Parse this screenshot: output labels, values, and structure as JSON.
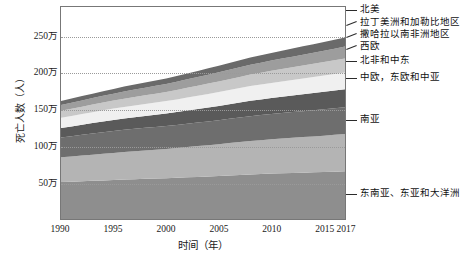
{
  "chart_data": {
    "type": "area",
    "title": "",
    "subtitle": "",
    "xlabel": "时间（年）",
    "ylabel": "死亡人数（人）",
    "xlim": [
      1990,
      2017
    ],
    "ylim": [
      0,
      290
    ],
    "grid": true,
    "legend_position": "right",
    "stacked": true,
    "unit_note": "万人",
    "x": [
      1990,
      1991,
      1992,
      1993,
      1994,
      1995,
      1996,
      1997,
      1998,
      1999,
      2000,
      2001,
      2002,
      2003,
      2004,
      2005,
      2006,
      2007,
      2008,
      2009,
      2010,
      2011,
      2012,
      2013,
      2014,
      2015,
      2016,
      2017
    ],
    "xticks": [
      "1990",
      "1995",
      "2000",
      "2005",
      "2010",
      "2015",
      "2017"
    ],
    "xtick_values": [
      1990,
      1995,
      2000,
      2005,
      2010,
      2015,
      2017
    ],
    "yticks": [
      "50万",
      "100万",
      "150万",
      "200万",
      "250万"
    ],
    "ytick_values": [
      50,
      100,
      150,
      200,
      250
    ],
    "series": [
      {
        "name": "东南亚、东亚和大洋洲",
        "color": "#8e8e8e",
        "values": [
          50.5,
          51.0,
          51.6,
          52.2,
          52.8,
          53.4,
          54.0,
          54.5,
          55.0,
          55.4,
          55.9,
          56.4,
          57.0,
          57.6,
          58.2,
          58.9,
          59.6,
          60.3,
          61.0,
          61.6,
          62.2,
          62.6,
          63.0,
          63.4,
          63.8,
          64.2,
          64.7,
          65.2
        ]
      },
      {
        "name": "南亚",
        "color": "#b4b4b4",
        "values": [
          34.0,
          34.6,
          35.2,
          35.8,
          36.4,
          37.0,
          37.6,
          38.2,
          38.8,
          39.4,
          40.0,
          40.7,
          41.4,
          42.1,
          42.8,
          43.5,
          44.2,
          44.9,
          45.6,
          46.2,
          46.8,
          47.4,
          48.0,
          48.6,
          49.2,
          49.8,
          50.4,
          51.0
        ]
      },
      {
        "name": "中欧，东欧和中亚",
        "color": "#6e6e6e",
        "values": [
          27.0,
          27.6,
          28.3,
          29.0,
          29.6,
          30.1,
          30.5,
          30.8,
          31.0,
          31.2,
          31.4,
          31.6,
          31.9,
          32.2,
          32.5,
          32.8,
          33.2,
          33.6,
          34.0,
          34.3,
          34.6,
          34.9,
          35.2,
          35.5,
          35.8,
          36.1,
          36.4,
          36.7
        ]
      },
      {
        "name": "北非和中东",
        "color": "#5a5a5a",
        "values": [
          13.0,
          13.4,
          13.8,
          14.2,
          14.6,
          15.0,
          15.4,
          15.8,
          16.2,
          16.6,
          17.0,
          17.5,
          18.0,
          18.5,
          19.0,
          19.5,
          20.0,
          20.5,
          21.0,
          21.4,
          21.8,
          22.2,
          22.6,
          23.0,
          23.4,
          23.8,
          24.2,
          24.6
        ]
      },
      {
        "name": "西欧",
        "color": "#f0f0f0",
        "values": [
          14.0,
          14.3,
          14.6,
          14.9,
          15.2,
          15.5,
          15.8,
          16.1,
          16.4,
          16.7,
          17.0,
          17.4,
          17.8,
          18.2,
          18.6,
          19.0,
          19.4,
          19.8,
          20.2,
          20.5,
          20.8,
          21.1,
          21.4,
          21.7,
          22.0,
          22.3,
          22.6,
          22.9
        ]
      },
      {
        "name": "撒哈拉以南非洲地区",
        "color": "#c8c8c8",
        "values": [
          9.5,
          9.8,
          10.1,
          10.4,
          10.7,
          11.0,
          11.3,
          11.6,
          11.9,
          12.2,
          12.5,
          12.9,
          13.3,
          13.7,
          14.1,
          14.5,
          14.9,
          15.3,
          15.7,
          16.1,
          16.5,
          16.9,
          17.3,
          17.7,
          18.1,
          18.5,
          18.9,
          19.3
        ]
      },
      {
        "name": "拉丁美洲和加勒比地区",
        "color": "#9d9d9d",
        "values": [
          8.0,
          8.3,
          8.6,
          8.9,
          9.2,
          9.5,
          9.8,
          10.1,
          10.4,
          10.7,
          11.0,
          11.3,
          11.6,
          11.9,
          12.2,
          12.5,
          12.8,
          13.1,
          13.4,
          13.7,
          14.0,
          14.3,
          14.6,
          14.9,
          15.2,
          15.5,
          15.8,
          16.1
        ]
      },
      {
        "name": "北美",
        "color": "#6a6a6a",
        "values": [
          5.5,
          5.7,
          5.9,
          6.1,
          6.3,
          6.5,
          6.7,
          6.9,
          7.1,
          7.3,
          7.5,
          7.8,
          8.1,
          8.4,
          8.7,
          9.0,
          9.3,
          9.6,
          9.9,
          10.2,
          10.5,
          10.8,
          11.1,
          11.4,
          11.7,
          12.0,
          12.3,
          12.6
        ]
      }
    ],
    "legend_entries": [
      {
        "label": "北美",
        "y": 10,
        "slant": false
      },
      {
        "label": "拉丁美洲和加勒比地区",
        "y": 23,
        "slant": true
      },
      {
        "label": "撒哈拉以南非洲地区",
        "y": 35,
        "slant": true
      },
      {
        "label": "西欧",
        "y": 47,
        "slant": true
      },
      {
        "label": "北非和中东",
        "y": 61,
        "slant": false
      },
      {
        "label": "中欧，东欧和中亚",
        "y": 78,
        "slant": false
      },
      {
        "label": "南亚",
        "y": 120,
        "slant": false
      },
      {
        "label": "东南亚、东亚和大洋洲",
        "y": 194,
        "slant": false
      }
    ]
  }
}
